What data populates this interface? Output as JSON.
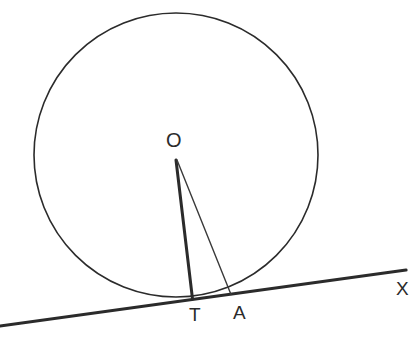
{
  "figure": {
    "kind": "geometry-diagram",
    "width": 419,
    "height": 338,
    "background_color": "#ffffff",
    "stroke_color": "#2b2b2b",
    "thin_stroke_color": "#3a3a3a"
  },
  "labels": {
    "center": "O",
    "tangency_point": "T",
    "point_a": "A",
    "ray_end": "X"
  },
  "elements": {
    "circle": {
      "name": "circle",
      "cx": 176,
      "cy": 155,
      "r": 142,
      "stroke_width": 1.6,
      "fill": "none"
    },
    "tangent_line": {
      "name": "tangent-line-TX",
      "x1": 0,
      "y1": 326,
      "x2": 406,
      "y2": 270,
      "stroke_width": 3.2
    },
    "radius_OT": {
      "name": "segment-OT",
      "x1": 176,
      "y1": 160,
      "x2": 192.5,
      "y2": 299,
      "stroke_width": 3.0
    },
    "segment_OA": {
      "name": "segment-OA",
      "x1": 177,
      "y1": 160,
      "x2": 231,
      "y2": 294.5,
      "stroke_width": 1.4
    }
  },
  "chart_data": {
    "type": "scatter",
    "title": "",
    "xlabel": "",
    "ylabel": "",
    "points": [
      {
        "label": "O",
        "x": 176,
        "y": 160,
        "role": "circle-center"
      },
      {
        "label": "T",
        "x": 192,
        "y": 299,
        "role": "point-of-tangency"
      },
      {
        "label": "A",
        "x": 231,
        "y": 294,
        "role": "point-on-tangent"
      },
      {
        "label": "X",
        "x": 406,
        "y": 270,
        "role": "tangent-ray-endpoint"
      }
    ]
  }
}
